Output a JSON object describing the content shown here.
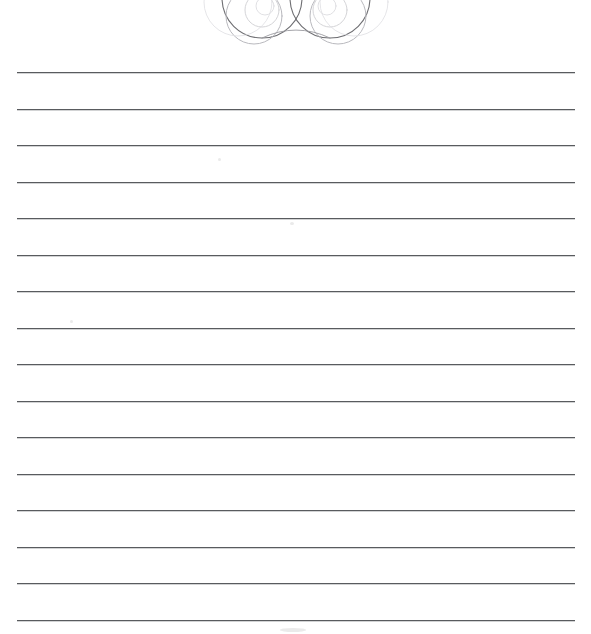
{
  "document": {
    "title": "Lined Writing Paper",
    "page_type": "ruled-stationery",
    "background_color": "#ffffff",
    "width_px": 591,
    "height_px": 634
  },
  "ornament": {
    "name": "decorative-swirl-flourish",
    "description": "Symmetric pair of interlocking spiral scroll circles, cropped by the top page edge",
    "stroke_color": "#6e6e72",
    "light_stroke_color": "#c9c9cd",
    "center_x": 296,
    "left_edge_x": 222,
    "right_edge_x": 372,
    "bottom_y": 46
  },
  "ruling": {
    "line_count": 16,
    "line_color": "#595b5e",
    "line_thickness_px": 1.4,
    "left_margin_px": 17,
    "right_margin_px": 575,
    "first_line_y": 72,
    "line_spacing_px": 36.5,
    "lines_y": [
      72,
      108.5,
      145,
      181.5,
      218,
      254.5,
      291,
      327.5,
      364,
      400.5,
      437,
      473.5,
      510,
      546.5,
      583,
      619.5
    ]
  },
  "artifacts": [
    {
      "name": "scan-smudge-upper",
      "x": 218,
      "y": 158,
      "w": 3,
      "h": 3
    },
    {
      "name": "scan-smudge-mid",
      "x": 290,
      "y": 222,
      "w": 4,
      "h": 3
    },
    {
      "name": "scan-smudge-lower",
      "x": 70,
      "y": 320,
      "w": 3,
      "h": 3
    },
    {
      "name": "scan-smudge-bottom",
      "x": 280,
      "y": 628,
      "w": 26,
      "h": 4
    }
  ]
}
